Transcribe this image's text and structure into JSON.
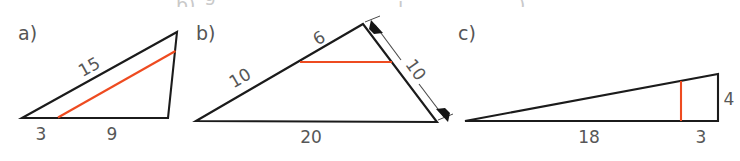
{
  "figure": {
    "colors": {
      "stroke": "#1b1b1b",
      "cut": "#ee4b20",
      "dimension": "#4a4a4a",
      "label": "#575757",
      "background": "#ffffff"
    },
    "panels": [
      {
        "tag": "a)",
        "shape": "triangle",
        "cut_orientation": "parallel-to-hypotenuse",
        "labels": {
          "hypotenuse": "15",
          "base_left": "3",
          "base_right": "9"
        }
      },
      {
        "tag": "b)",
        "shape": "triangle",
        "cut_orientation": "parallel-to-base",
        "labels": {
          "upper_left_side": "6",
          "lower_left_side": "10",
          "base": "20",
          "right_side_dimension": "10"
        }
      },
      {
        "tag": "c)",
        "shape": "triangle",
        "cut_orientation": "vertical",
        "labels": {
          "base_left": "18",
          "base_right": "3",
          "right_side": "4"
        }
      }
    ],
    "ghost_text_top": [
      {
        "glyph": "g",
        "x": 206
      },
      {
        "glyph": "b)",
        "x": 176
      },
      {
        "glyph": "j",
        "x": 398
      },
      {
        "glyph": ")",
        "x": 520
      }
    ]
  }
}
